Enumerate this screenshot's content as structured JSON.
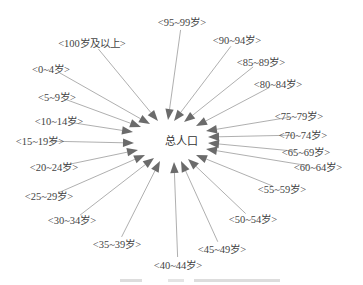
{
  "diagram": {
    "type": "radial-influence-diagram",
    "center": {
      "label": "总人口",
      "x": 181,
      "y": 141
    },
    "nodes": [
      {
        "label": "<95~99岁>",
        "x": 182,
        "y": 22,
        "ax": 168,
        "ay": 120
      },
      {
        "label": "<90~94岁>",
        "x": 237,
        "y": 40,
        "ax": 174,
        "ay": 121
      },
      {
        "label": "<85~89岁>",
        "x": 261,
        "y": 62,
        "ax": 184,
        "ay": 122
      },
      {
        "label": "<80~84岁>",
        "x": 278,
        "y": 84,
        "ax": 196,
        "ay": 126
      },
      {
        "label": "<75~79岁>",
        "x": 299,
        "y": 116,
        "ax": 206,
        "ay": 131
      },
      {
        "label": "<70~74岁>",
        "x": 303,
        "y": 135,
        "ax": 208,
        "ay": 137
      },
      {
        "label": "<65~69岁>",
        "x": 306,
        "y": 152,
        "ax": 208,
        "ay": 143
      },
      {
        "label": "<60~64岁>",
        "x": 318,
        "y": 167,
        "ax": 206,
        "ay": 149
      },
      {
        "label": "<55~59岁>",
        "x": 282,
        "y": 189,
        "ax": 196,
        "ay": 155
      },
      {
        "label": "<50~54岁>",
        "x": 253,
        "y": 219,
        "ax": 188,
        "ay": 159
      },
      {
        "label": "<45~49岁>",
        "x": 222,
        "y": 249,
        "ax": 181,
        "ay": 161
      },
      {
        "label": "<40~44岁>",
        "x": 178,
        "y": 265,
        "ax": 174,
        "ay": 162
      },
      {
        "label": "<35~39岁>",
        "x": 117,
        "y": 244,
        "ax": 160,
        "ay": 161
      },
      {
        "label": "<30~34岁>",
        "x": 72,
        "y": 220,
        "ax": 154,
        "ay": 158
      },
      {
        "label": "<25~29岁>",
        "x": 49,
        "y": 196,
        "ax": 145,
        "ay": 155
      },
      {
        "label": "<20~24岁>",
        "x": 54,
        "y": 167,
        "ax": 138,
        "ay": 150
      },
      {
        "label": "<15~19岁>",
        "x": 40,
        "y": 141,
        "ax": 134,
        "ay": 143
      },
      {
        "label": "<10~14岁>",
        "x": 59,
        "y": 121,
        "ax": 133,
        "ay": 132
      },
      {
        "label": "<5~9岁>",
        "x": 57,
        "y": 97,
        "ax": 141,
        "ay": 127
      },
      {
        "label": "<0~4岁>",
        "x": 51,
        "y": 69,
        "ax": 150,
        "ay": 124
      },
      {
        "label": "<100岁及以上>",
        "x": 92,
        "y": 43,
        "ax": 158,
        "ay": 121
      }
    ],
    "colors": {
      "line": "#a6a6a6",
      "arrow": "#6b6b6b",
      "text": "#444444"
    }
  }
}
